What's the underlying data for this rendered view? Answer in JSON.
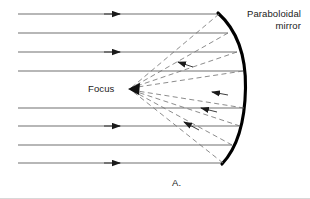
{
  "figure": {
    "caption": "A.",
    "labels": {
      "mirror_line1": "Paraboloidal",
      "mirror_line2": "mirror",
      "focus": "Focus"
    },
    "colors": {
      "ink": "#1a1a1a",
      "ray_incoming": "#555555",
      "ray_reflected": "#777777",
      "mirror": "#000000",
      "background": "#ffffff"
    },
    "optics": {
      "mirror_type": "paraboloidal concave mirror",
      "mirror_vertex": [
        245,
        88
      ],
      "mirror_top_end": [
        218,
        13
      ],
      "mirror_bottom_end": [
        222,
        164
      ],
      "focus_point": [
        130,
        89
      ],
      "incoming_ray_direction": "left-to-right, parallel to optical axis",
      "reflected_ray_direction": "toward focus",
      "incoming_ray_start_x": 18,
      "incoming_ray_y": [
        14,
        33,
        52,
        71,
        108,
        126,
        145,
        163
      ],
      "incoming_ray_arrow_x": [
        118,
        118,
        118,
        118,
        118,
        118,
        118,
        118
      ],
      "incoming_arrow_rows": [
        0,
        2,
        5,
        7
      ],
      "reflected_arrow_rows": [
        2,
        4,
        5,
        7
      ]
    }
  }
}
